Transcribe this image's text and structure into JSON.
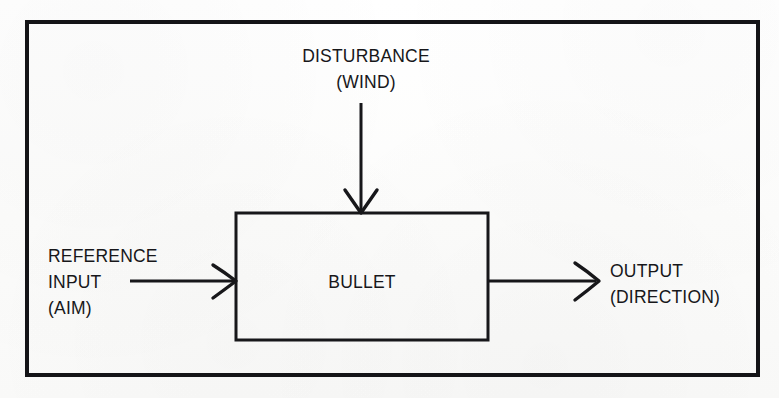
{
  "figure": {
    "kind": "block-diagram",
    "title_visible": false,
    "background_color": "#fdfdfc",
    "ink_color": "#17171a"
  },
  "frame": {
    "name": "outer-border",
    "x": 27,
    "y": 22,
    "width": 731,
    "height": 353,
    "stroke_width": 4
  },
  "blocks": [
    {
      "id": "plant",
      "label": "BULLET",
      "x": 236,
      "y": 213,
      "width": 252,
      "height": 127,
      "stroke_width": 3
    }
  ],
  "signals": {
    "disturbance": {
      "label_line1": "DISTURBANCE",
      "label_line2": "(WIND)",
      "label_x": 366,
      "label_line1_y": 62,
      "label_line2_y": 88,
      "arrow_x": 361,
      "arrow_y_start": 103,
      "arrow_y_end": 213,
      "direction": "down"
    },
    "reference": {
      "label_line1": "REFERENCE",
      "label_line2": "INPUT",
      "label_line3": "(AIM)",
      "label_x": 48,
      "label_line1_y": 262,
      "label_line2_y": 288,
      "label_line3_y": 314,
      "arrow_x_start": 130,
      "arrow_x_end": 236,
      "arrow_y": 281,
      "direction": "right"
    },
    "output": {
      "label_line1": "OUTPUT",
      "label_line2": "(DIRECTION)",
      "label_x": 610,
      "label_line1_y": 277,
      "label_line2_y": 303,
      "arrow_x_start": 488,
      "arrow_x_end": 598,
      "arrow_y": 281,
      "direction": "right"
    }
  },
  "legend": {
    "description": "Open-loop control system example: aim is the reference input, the bullet is the plant, wind is the disturbance, and direction is the output."
  }
}
